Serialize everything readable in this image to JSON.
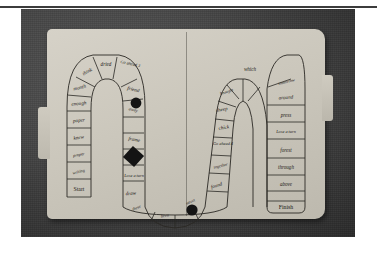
{
  "document": {
    "figure_kind": "photograph",
    "subject": "handmade file-folder word board game",
    "background_color": "#4a4a4a",
    "folder_color": "#cbc7bc",
    "ink_color": "#1d1b18",
    "token_color": "#141414"
  },
  "board": {
    "start_label": "Start",
    "finish_label": "Finish",
    "paths": [
      {
        "name": "left-descending-column",
        "cells": [
          {
            "id": "L1",
            "text": "Start"
          },
          {
            "id": "L2",
            "text": "writing"
          },
          {
            "id": "L3",
            "text": "proper"
          },
          {
            "id": "L4",
            "text": "knew"
          },
          {
            "id": "L5",
            "text": "paper"
          },
          {
            "id": "L6",
            "text": "enough"
          },
          {
            "id": "L7",
            "text": "month"
          },
          {
            "id": "L8",
            "text": "think"
          },
          {
            "id": "L9",
            "text": "dried"
          },
          {
            "id": "L10",
            "text": "Go ahead 3"
          }
        ]
      },
      {
        "name": "left-inner-descending",
        "cells": [
          {
            "id": "M1",
            "text": "friend"
          },
          {
            "id": "M2",
            "text": "away",
            "token": "circle"
          },
          {
            "id": "M3",
            "text": "frame"
          },
          {
            "id": "M4",
            "text": "",
            "token": "diamond"
          },
          {
            "id": "M5",
            "text": "Lose a turn"
          },
          {
            "id": "M6",
            "text": "draw"
          },
          {
            "id": "M7",
            "text": "these"
          }
        ]
      },
      {
        "name": "valley-bottom",
        "cells": [
          {
            "id": "B1",
            "text": "been"
          },
          {
            "id": "B2",
            "text": "street",
            "token": "circle"
          }
        ]
      },
      {
        "name": "right-inner-ascending",
        "cells": [
          {
            "id": "R1",
            "text": "found"
          },
          {
            "id": "R2",
            "text": "together"
          },
          {
            "id": "R3",
            "text": "Go ahead 4"
          },
          {
            "id": "R4",
            "text": "chick"
          },
          {
            "id": "R5",
            "text": "sheep"
          },
          {
            "id": "R6",
            "text": "brought"
          },
          {
            "id": "R7",
            "text": "which"
          }
        ]
      },
      {
        "name": "right-descending-column",
        "cells": [
          {
            "id": "F1",
            "text": "tomorrow"
          },
          {
            "id": "F2",
            "text": "around"
          },
          {
            "id": "F3",
            "text": "press"
          },
          {
            "id": "F4",
            "text": "Lose a turn"
          },
          {
            "id": "F5",
            "text": "forest"
          },
          {
            "id": "F6",
            "text": "through"
          },
          {
            "id": "F7",
            "text": "above"
          },
          {
            "id": "F8",
            "text": "Finish"
          }
        ]
      }
    ],
    "tokens": [
      {
        "shape": "circle",
        "on_cell": "away"
      },
      {
        "shape": "diamond",
        "on_cell": "frame-lose-a-turn"
      },
      {
        "shape": "circle",
        "on_cell": "street"
      }
    ]
  }
}
